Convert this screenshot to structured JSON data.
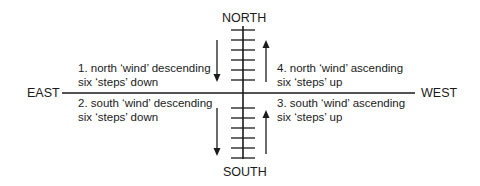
{
  "directions": {
    "north": "NORTH",
    "south": "SOUTH",
    "east": "EAST",
    "west": "WEST"
  },
  "quadrants": [
    {
      "id": 1,
      "line1": "1. north ‘wind’  descending",
      "line2": "six ‘steps’ down",
      "arrow": "down"
    },
    {
      "id": 2,
      "line1": "2. south ‘wind’  descending",
      "line2": "six ‘steps’ down",
      "arrow": "down"
    },
    {
      "id": 3,
      "line1": "3. south ‘wind’  ascending",
      "line2": "six ‘steps’ up",
      "arrow": "up"
    },
    {
      "id": 4,
      "line1": "4. north ‘wind’  ascending",
      "line2": "six ‘steps’ up",
      "arrow": "up"
    }
  ],
  "ladder": {
    "north_steps": 6,
    "south_steps": 6
  },
  "colors": {
    "ink": "#1a1a1a",
    "background": "#ffffff"
  }
}
